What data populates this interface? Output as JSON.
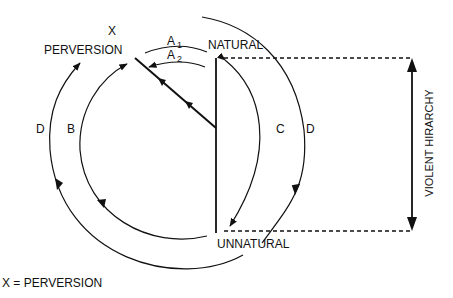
{
  "labels": {
    "x": "X",
    "perversion": "PERVERSION",
    "natural": "NATURAL",
    "unnatural": "UNNATURAL",
    "a1_main": "A",
    "a1_sub": "1",
    "a2_main": "A",
    "a2_sub": "2",
    "b": "B",
    "c": "C",
    "d_left": "D",
    "d_right": "D",
    "violent_hierarchy": "VIOLENT HIRARCHY",
    "legend": "X = PERVERSION"
  },
  "colors": {
    "stroke": "#111111",
    "background": "#ffffff"
  }
}
